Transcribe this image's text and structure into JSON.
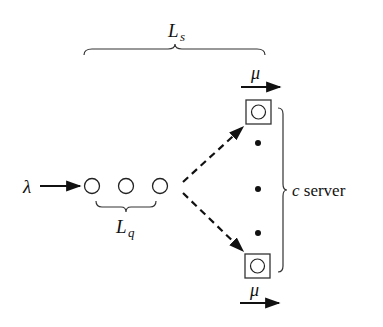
{
  "diagram": {
    "type": "M/M/c queueing system",
    "labels": {
      "arrival_rate": "λ",
      "service_rate_top": "μ",
      "service_rate_bottom": "μ",
      "system_length_main": "L",
      "system_length_sub": "s",
      "queue_length_main": "L",
      "queue_length_sub": "q",
      "servers_var": "c",
      "servers_text": " server"
    },
    "queue_circles": 3,
    "servers_shown": 2,
    "ellipsis_dots": 3,
    "colors": {
      "stroke": "#222222",
      "fill": "#111111",
      "background": "#ffffff"
    }
  }
}
